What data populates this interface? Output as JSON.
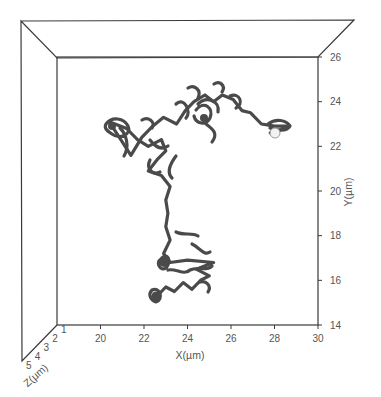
{
  "chart_data": {
    "type": "line",
    "subtype": "3d-trajectory",
    "title": "",
    "xlabel": "X(µm)",
    "ylabel": "Y(µm)",
    "zlabel": "Z(µm)",
    "xlim": [
      18,
      30
    ],
    "ylim": [
      14,
      26
    ],
    "zlim": [
      1,
      5
    ],
    "x_ticks": [
      "20",
      "22",
      "24",
      "26",
      "28",
      "30"
    ],
    "y_ticks": [
      "14",
      "16",
      "18",
      "20",
      "22",
      "24",
      "26"
    ],
    "z_ticks": [
      "1",
      "2",
      "3",
      "4",
      "5"
    ],
    "grid": false,
    "legend": null,
    "series": [
      {
        "name": "particle trajectory",
        "color": "#4a4a4a",
        "points_xy_um": [
          [
            22.6,
            15.3
          ],
          [
            23.0,
            15.7
          ],
          [
            23.4,
            15.5
          ],
          [
            23.8,
            15.9
          ],
          [
            24.2,
            15.6
          ],
          [
            24.6,
            16.0
          ],
          [
            25.0,
            16.2
          ],
          [
            24.4,
            16.5
          ],
          [
            25.2,
            16.8
          ],
          [
            24.0,
            16.9
          ],
          [
            23.2,
            16.8
          ],
          [
            22.9,
            17.2
          ],
          [
            23.2,
            17.8
          ],
          [
            23.0,
            18.4
          ],
          [
            23.1,
            19.0
          ],
          [
            23.0,
            19.6
          ],
          [
            23.2,
            20.2
          ],
          [
            22.8,
            20.7
          ],
          [
            22.2,
            20.9
          ],
          [
            22.6,
            21.4
          ],
          [
            23.0,
            21.8
          ],
          [
            22.8,
            22.3
          ],
          [
            22.2,
            22.0
          ],
          [
            21.7,
            22.3
          ],
          [
            21.2,
            22.8
          ],
          [
            20.4,
            23.1
          ],
          [
            20.8,
            22.5
          ],
          [
            21.4,
            21.6
          ],
          [
            21.9,
            22.4
          ],
          [
            22.4,
            22.9
          ],
          [
            22.9,
            23.3
          ],
          [
            23.5,
            23.0
          ],
          [
            23.9,
            23.6
          ],
          [
            24.3,
            24.0
          ],
          [
            24.8,
            24.3
          ],
          [
            25.2,
            24.0
          ],
          [
            25.6,
            24.3
          ],
          [
            26.1,
            24.1
          ],
          [
            26.5,
            23.6
          ],
          [
            26.9,
            23.5
          ],
          [
            27.4,
            23.0
          ],
          [
            28.0,
            22.9
          ],
          [
            28.6,
            22.9
          ],
          [
            28.2,
            22.7
          ],
          [
            27.8,
            22.6
          ]
        ],
        "start_marker": {
          "x_um": 22.6,
          "y_um": 15.3,
          "style": "dark blob"
        },
        "end_marker": {
          "x_um": 27.8,
          "y_um": 22.6,
          "style": "white sphere"
        }
      }
    ]
  }
}
